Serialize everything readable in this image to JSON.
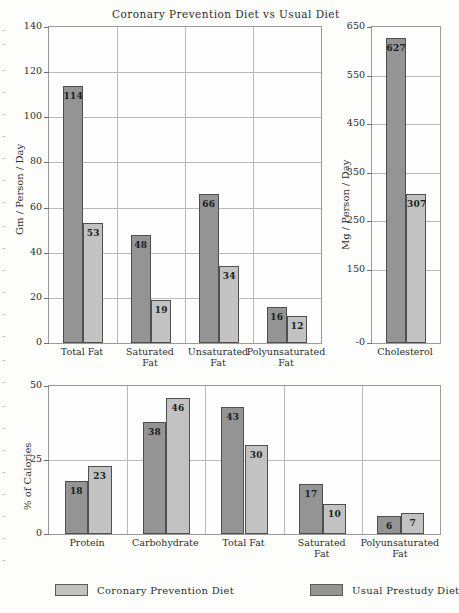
{
  "title": "Coronary Prevention Diet vs Usual Diet",
  "legend": {
    "items": [
      {
        "label": "Coronary Prevention Diet",
        "swatch": "light",
        "color": "#c2c2c2"
      },
      {
        "label": "Usual Prestudy Diet",
        "swatch": "dark",
        "color": "#949494"
      }
    ]
  },
  "chart_data": [
    {
      "id": "fat-grams",
      "type": "bar",
      "title": "Coronary Prevention Diet vs Usual Diet",
      "xlabel": "",
      "ylabel": "Gm / Person / Day",
      "ylim": [
        0,
        140
      ],
      "yticks": [
        0,
        20,
        40,
        60,
        80,
        100,
        120,
        140
      ],
      "grid": true,
      "legend_position": "bottom",
      "categories": [
        "Total Fat",
        "Saturated\nFat",
        "Unsaturated\nFat",
        "Polyunsaturated\nFat"
      ],
      "series": [
        {
          "name": "Usual Prestudy Diet",
          "color": "#949494",
          "values": [
            114,
            48,
            66,
            16
          ]
        },
        {
          "name": "Coronary Prevention Diet",
          "color": "#c2c2c2",
          "values": [
            53,
            19,
            34,
            12
          ]
        }
      ]
    },
    {
      "id": "cholesterol-mg",
      "type": "bar",
      "title": "",
      "xlabel": "",
      "ylabel": "Mg / Person / Day",
      "ylim": [
        0,
        650
      ],
      "yticks": [
        0,
        150,
        250,
        350,
        450,
        550,
        650
      ],
      "ytick_labels": [
        "-0",
        "150",
        "250",
        "350",
        "450",
        "550",
        "650"
      ],
      "grid": true,
      "categories": [
        "Cholesterol"
      ],
      "series": [
        {
          "name": "Usual Prestudy Diet",
          "color": "#949494",
          "values": [
            627
          ]
        },
        {
          "name": "Coronary Prevention Diet",
          "color": "#c2c2c2",
          "values": [
            307
          ]
        }
      ]
    },
    {
      "id": "percent-calories",
      "type": "bar",
      "title": "",
      "xlabel": "",
      "ylabel": "% of Calories",
      "ylim": [
        0,
        50
      ],
      "yticks": [
        0,
        25,
        50
      ],
      "grid": true,
      "categories": [
        "Protein",
        "Carbohydrate",
        "Total Fat",
        "Saturated\nFat",
        "Polyunsaturated\nFat"
      ],
      "series": [
        {
          "name": "Usual Prestudy Diet",
          "color": "#949494",
          "values": [
            18,
            38,
            43,
            17,
            6
          ]
        },
        {
          "name": "Coronary Prevention Diet",
          "color": "#c2c2c2",
          "values": [
            23,
            46,
            30,
            10,
            7
          ]
        }
      ]
    }
  ]
}
